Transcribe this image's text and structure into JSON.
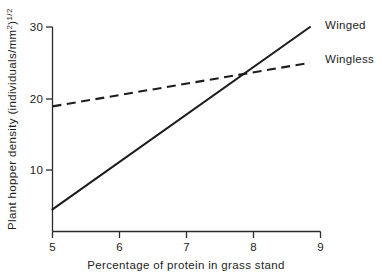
{
  "chart_data": {
    "type": "line",
    "title": "",
    "xlabel": "Percentage of protein in grass stand",
    "ylabel": "Plant hopper density (individuals/mm",
    "ylabel_exponent": "2",
    "ylabel_close": ")",
    "ylabel_power": "1/2",
    "xlim": [
      5,
      9
    ],
    "ylim": [
      0,
      30
    ],
    "xticks": [
      5,
      6,
      7,
      8,
      9
    ],
    "xtick_labels": [
      "5",
      "6",
      "7",
      "8",
      "9"
    ],
    "yticks": [
      10,
      20,
      30
    ],
    "ytick_labels": [
      "10",
      "20",
      "30"
    ],
    "grid": false,
    "legend_position": "right",
    "series": [
      {
        "name": "Winged",
        "style": "solid",
        "x": [
          5,
          9
        ],
        "values": [
          4.5,
          30.0
        ]
      },
      {
        "name": "Wingless",
        "style": "dashed",
        "x": [
          5,
          9
        ],
        "values": [
          18.9,
          25.0
        ]
      }
    ],
    "annotations": [
      {
        "text": "Winged",
        "x": 9.1,
        "y": 30.5
      },
      {
        "text": "Wingless",
        "x": 9.1,
        "y": 25.6
      }
    ],
    "intersection": {
      "x": 8.15,
      "y": 23.5
    }
  },
  "legend": {
    "winged_label": "Winged",
    "wingless_label": "Wingless"
  },
  "colors": {
    "ink": "#1d1d1d",
    "axis": "#2b2b2b",
    "background": "#ffffff"
  }
}
